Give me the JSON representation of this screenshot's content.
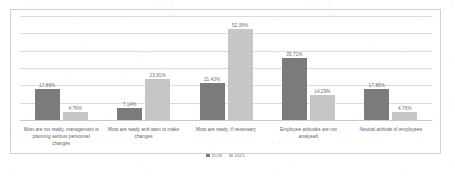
{
  "chart_data": {
    "type": "bar",
    "title": "",
    "xlabel": "",
    "ylabel": "",
    "ylim": [
      0,
      60
    ],
    "grid": true,
    "gridline_count": 7,
    "legend_position": "bottom-center",
    "categories": [
      "Most are not ready, management is planning serious personnel changes",
      "Most are ready and want to make changes",
      "Most are ready, if necessary",
      "Employee attitudes are not analysed",
      "Neutral attitude of employees"
    ],
    "series": [
      {
        "name": "2018",
        "color": "#7b7b7b",
        "values": [
          17.86,
          7.14,
          21.43,
          35.71,
          17.86
        ],
        "labels": [
          "17,86%",
          "7,14%",
          "21,43%",
          "35,71%",
          "17,86%"
        ]
      },
      {
        "name": "2021",
        "color": "#c6c6c6",
        "values": [
          4.76,
          23.81,
          52.38,
          14.29,
          4.76
        ],
        "labels": [
          "4,76%",
          "23,81%",
          "52,38%",
          "14,29%",
          "4,76%"
        ]
      }
    ]
  },
  "legend": {
    "items": [
      {
        "label": "2018"
      },
      {
        "label": "2021"
      }
    ]
  }
}
